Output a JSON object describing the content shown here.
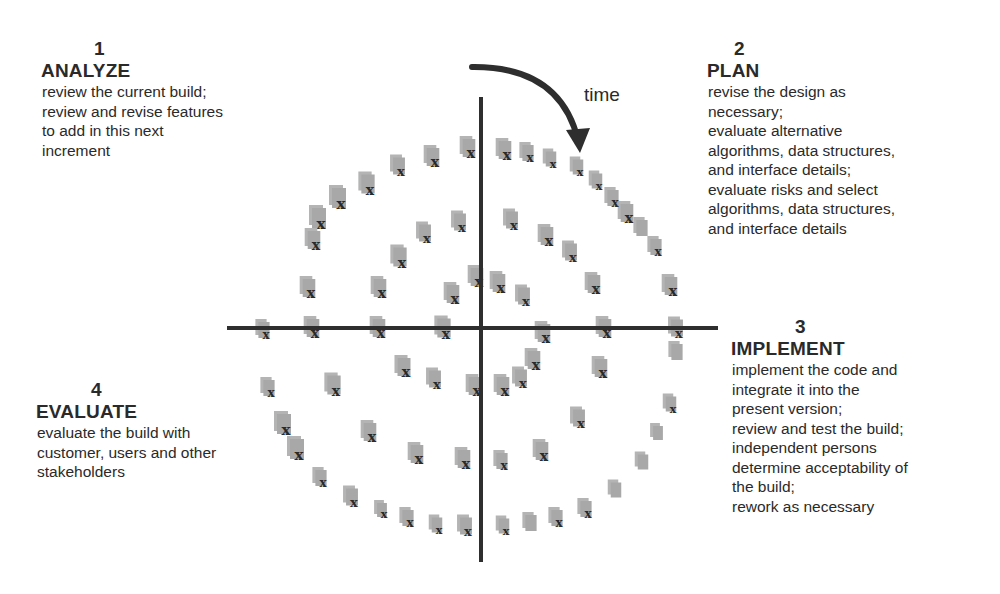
{
  "diagram": {
    "time_label": "time",
    "colors": {
      "axis": "#2e2e2e",
      "marker": "#a8a8a8",
      "marker_mark": "#2a2a2a",
      "text": "#2a2a2a",
      "background": "#ffffff"
    },
    "marker_glyph": "x",
    "marker_icon": "document-icon"
  },
  "phases": [
    {
      "number": "1",
      "title": "ANALYZE",
      "lines": [
        "review the current build;",
        "review and revise features",
        "to add in this next",
        "increment"
      ]
    },
    {
      "number": "2",
      "title": "PLAN",
      "lines": [
        "revise the design as",
        "necessary;",
        "evaluate alternative",
        "algorithms, data structures,",
        "and interface details;",
        "evaluate risks and select",
        "algorithms, data structures,",
        "and interface details"
      ]
    },
    {
      "number": "3",
      "title": "IMPLEMENT",
      "lines": [
        "implement the code and",
        "integrate it into the",
        "present version;",
        "review and test the build;",
        "independent persons",
        "determine acceptability of",
        "the build;",
        "rework as necessary"
      ]
    },
    {
      "number": "4",
      "title": "EVALUATE",
      "lines": [
        "evaluate the build with",
        "customer, users and other",
        "stakeholders"
      ]
    }
  ]
}
